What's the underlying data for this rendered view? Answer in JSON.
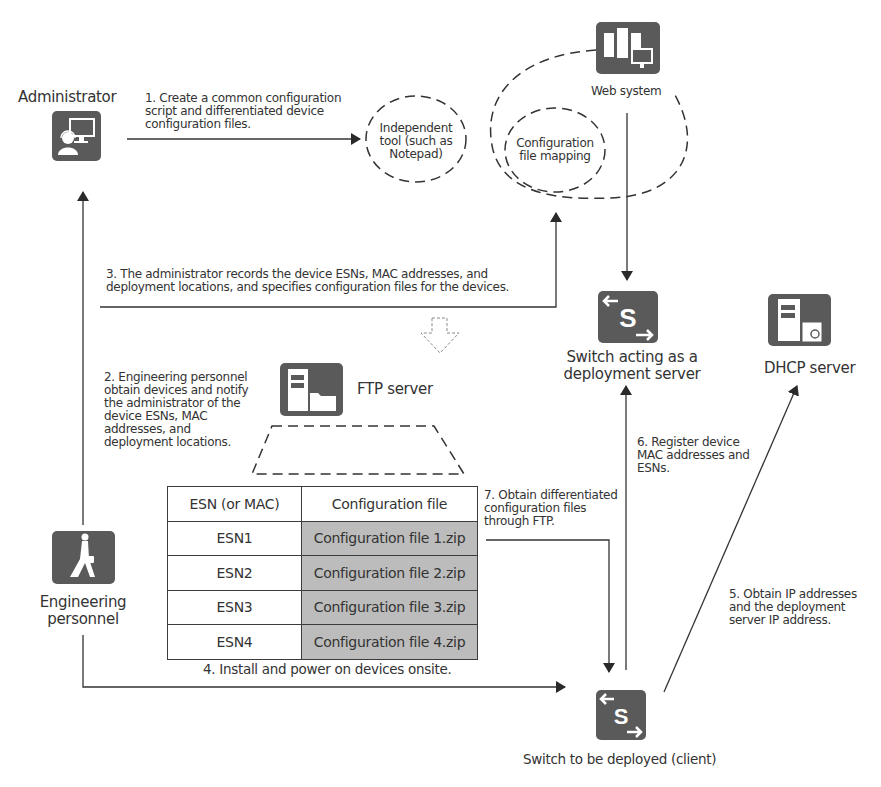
{
  "diagram": {
    "nodes": {
      "administrator": {
        "label": "Administrator",
        "icon": "administrator-icon"
      },
      "independent_tool": {
        "label": "Independent\ntool (such as\nNotepad)"
      },
      "web_system": {
        "label": "Web system",
        "icon": "web-system-icon"
      },
      "config_mapping": {
        "label": "Configuration\nfile mapping"
      },
      "ftp_server": {
        "label": "FTP server",
        "icon": "ftp-server-icon"
      },
      "deployment_server": {
        "label": "Switch acting as a\ndeployment server",
        "icon": "switch-icon"
      },
      "dhcp_server": {
        "label": "DHCP server",
        "icon": "dhcp-server-icon"
      },
      "engineering": {
        "label": "Engineering\npersonnel",
        "icon": "engineer-icon"
      },
      "client_switch": {
        "label": "Switch to be deployed (client)",
        "icon": "switch-icon"
      }
    },
    "steps": {
      "step1": "1. Create a common configuration\nscript and differentiated device\nconfiguration files.",
      "step2": "2. Engineering personnel\nobtain devices and notify\nthe administrator of the\ndevice ESNs, MAC\naddresses, and\ndeployment locations.",
      "step3": "3. The administrator records the device ESNs, MAC addresses, and\ndeployment locations, and specifies configuration files for the devices.",
      "step4": "4. Install and power on devices onsite.",
      "step5": "5. Obtain IP addresses\nand the deployment\nserver IP address.",
      "step6": "6. Register device\nMAC addresses and\nESNs.",
      "step7": "7. Obtain differentiated\nconfiguration files\nthrough FTP."
    },
    "mapping_table": {
      "headers": [
        "ESN (or MAC)",
        "Configuration file"
      ],
      "rows": [
        [
          "ESN1",
          "Configuration file 1.zip"
        ],
        [
          "ESN2",
          "Configuration file 2.zip"
        ],
        [
          "ESN3",
          "Configuration file 3.zip"
        ],
        [
          "ESN4",
          "Configuration file 4.zip"
        ]
      ]
    },
    "colors": {
      "icon_bg": "#5a5a5a",
      "line": "#333333",
      "table_file_cell": "#bcbcbc"
    }
  }
}
